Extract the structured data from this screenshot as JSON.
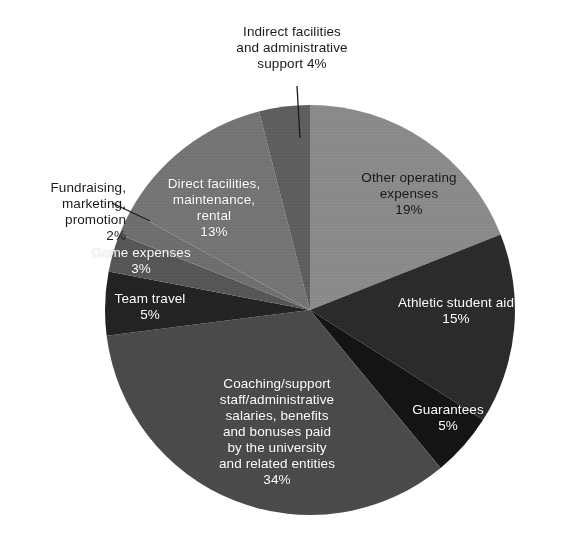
{
  "chart_data": {
    "type": "pie",
    "title": "",
    "subtitle": "",
    "xlabel": "",
    "ylabel": "",
    "legend_position": "none",
    "grid": false,
    "start_angle_deg": 0,
    "direction": "clockwise",
    "center": {
      "x": 310,
      "y": 310
    },
    "radius": 205,
    "categories": [
      "Other operating expenses",
      "Athletic student aid",
      "Guarantees",
      "Coaching/support staff/administrative salaries, benefits and bonuses paid by the university and related entities",
      "Team travel",
      "Game expenses",
      "Fundraising, marketing, promotion",
      "Direct facilities, maintenance, rental",
      "Indirect facilities and administrative support"
    ],
    "values": [
      19,
      15,
      5,
      34,
      5,
      3,
      2,
      13,
      4
    ],
    "value_suffix": "%",
    "slices": [
      {
        "id": "other-operating-expenses",
        "name": "Other operating expenses",
        "value": 19,
        "value_label": "19%",
        "label_lines": "Other operating\nexpenses\n19%",
        "color": "#8a8a8a",
        "label_color": "#1a1a1a",
        "label_placement": "inside"
      },
      {
        "id": "athletic-student-aid",
        "name": "Athletic student aid",
        "value": 15,
        "value_label": "15%",
        "label_lines": "Athletic student aid\n15%",
        "color": "#2b2b2b",
        "label_color": "#ffffff",
        "label_placement": "inside"
      },
      {
        "id": "guarantees",
        "name": "Guarantees",
        "value": 5,
        "value_label": "5%",
        "label_lines": "Guarantees\n5%",
        "color": "#141414",
        "label_color": "#ffffff",
        "label_placement": "inside"
      },
      {
        "id": "coaching-support-staff-salaries",
        "name": "Coaching/support staff/administrative salaries, benefits and bonuses paid by the university and related entities",
        "value": 34,
        "value_label": "34%",
        "label_lines": "Coaching/support\nstaff/administrative\nsalaries, benefits\nand bonuses paid\nby the university\nand related entities\n34%",
        "color": "#4a4a4a",
        "label_color": "#ffffff",
        "label_placement": "inside"
      },
      {
        "id": "team-travel",
        "name": "Team travel",
        "value": 5,
        "value_label": "5%",
        "label_lines": "Team travel\n5%",
        "color": "#232323",
        "label_color": "#ffffff",
        "label_placement": "inside"
      },
      {
        "id": "game-expenses",
        "name": "Game expenses",
        "value": 3,
        "value_label": "3%",
        "label_lines": "Game expenses\n3%",
        "color": "#565656",
        "label_color": "#ffffff",
        "label_placement": "inside"
      },
      {
        "id": "fundraising-marketing-promotion",
        "name": "Fundraising, marketing, promotion",
        "value": 2,
        "value_label": "2%",
        "label_lines": "Fundraising,\nmarketing,\npromotion\n2%",
        "color": "#6e6e6e",
        "label_color": "#1a1a1a",
        "label_placement": "outside",
        "has_leader_line": true
      },
      {
        "id": "direct-facilities-maintenance-rental",
        "name": "Direct facilities, maintenance, rental",
        "value": 13,
        "value_label": "13%",
        "label_lines": "Direct facilities,\nmaintenance,\nrental\n13%",
        "color": "#747474",
        "label_color": "#ffffff",
        "label_placement": "inside"
      },
      {
        "id": "indirect-facilities-administrative-support",
        "name": "Indirect facilities and administrative support",
        "value": 4,
        "value_label": "4%",
        "label_lines": "Indirect facilities\nand administrative\nsupport 4%",
        "color": "#5e5e5e",
        "label_color": "#1a1a1a",
        "label_placement": "outside",
        "has_leader_line": true
      }
    ],
    "total": 100,
    "background_color": "#ffffff"
  }
}
